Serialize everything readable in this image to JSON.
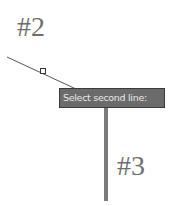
{
  "canvas": {
    "labels": {
      "line2": "#2",
      "line3": "#3"
    },
    "tooltip": {
      "text": "Select second line:"
    },
    "colors": {
      "background": "#ffffff",
      "thin_line": "#555555",
      "thick_line": "#7a7a7a",
      "tooltip_bg": "#6b6b6b",
      "tooltip_text": "#eaeaea",
      "label_text": "#6e6e6e"
    },
    "icons": {
      "pick-box": "small square snap marker"
    }
  }
}
